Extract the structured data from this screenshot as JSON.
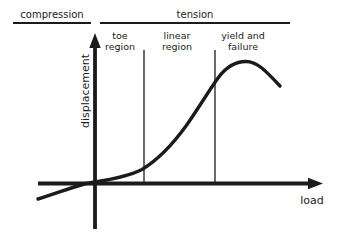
{
  "figure": {
    "colors": {
      "ink": "#1b1b1b",
      "background": "#ffffff"
    },
    "top_scale": {
      "compression_label": "compression",
      "tension_label": "tension"
    },
    "regions": [
      {
        "line1": "toe",
        "line2": "region"
      },
      {
        "line1": "linear",
        "line2": "region"
      },
      {
        "line1": "yield and",
        "line2": "failure"
      }
    ],
    "axes": {
      "y_label": "displacement",
      "x_label": "load"
    },
    "dividers": [
      {
        "x": 144
      },
      {
        "x": 215
      }
    ],
    "curve": {
      "description": "curve rises slowly through toe region, steeply through linear region, peaks then drops at yield and failure; extends below axis into compression quadrant",
      "path": "M 38 199 C 56 193.5, 70 188, 86 183.5 C 102 180.5, 124 178.5, 142 169.5 C 156 161, 170 148, 186 126 C 198 109, 208 92, 218 78 C 226 67, 236 61.5, 246 61.5 C 257 61.5, 265 70, 280 86",
      "key_points": [
        [
          38,
          199
        ],
        [
          86,
          183
        ],
        [
          142,
          169
        ],
        [
          186,
          126
        ],
        [
          218,
          78
        ],
        [
          246,
          62
        ],
        [
          280,
          86
        ]
      ]
    },
    "axis_geometry": {
      "y_axis_path": "M 95 229 L 95 46",
      "x_axis_path": "M 38 183.5 L 309 183.5",
      "y_arrow_points": "95,33 89.3,48 100.7,48",
      "x_arrow_points": "323,183.5 308,177.8 308,189.2"
    }
  }
}
